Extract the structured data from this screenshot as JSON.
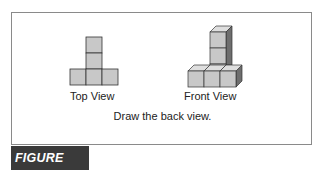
{
  "figure": {
    "label": "FIGURE 12.3",
    "label_bg": "#3a3a3a",
    "label_color": "#ffffff"
  },
  "top_cutoff_text": "...",
  "views": [
    {
      "id": "top",
      "caption": "Top View",
      "shape": "T-shape of 4 squares: 3 in bottom row, 2 stacked above center"
    },
    {
      "id": "front",
      "caption": "Front View",
      "shape": "isometric L-shape of cubes: row of 3 cubes in front, column of 3 cubes rising at back right"
    }
  ],
  "instruction": "Draw the back view.",
  "colors": {
    "cube_front": "#c8c8c8",
    "cube_top": "#dedede",
    "cube_side": "#6e6e6e",
    "stroke": "#333333",
    "frame": "#8a8a8a"
  }
}
